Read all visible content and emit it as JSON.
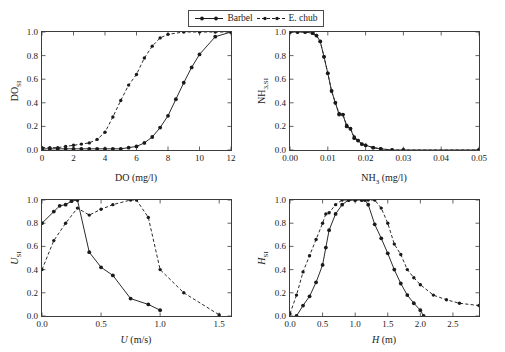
{
  "figure": {
    "background": "#ffffff",
    "line_color": "#2b2b2b",
    "marker_color": "#1a1a1a"
  },
  "legend": {
    "position": "top-center",
    "entries": [
      {
        "label": "Barbel",
        "style": "solid",
        "marker": "circle",
        "icon": "legend-solid-line-icon"
      },
      {
        "label": "E. chub",
        "style": "dashed",
        "marker": "circle",
        "icon": "legend-dashed-line-icon"
      }
    ]
  },
  "chart_data": [
    {
      "id": "do",
      "type": "line",
      "title": "",
      "xlabel": "DO (mg/l)",
      "ylabel": "DO_SI",
      "ylabel_main": "DO",
      "ylabel_sub": "SI",
      "xlim": [
        0,
        12
      ],
      "ylim": [
        0,
        1.0
      ],
      "xticks": [
        0,
        2,
        4,
        6,
        8,
        10,
        12
      ],
      "xticklabels": [
        "0",
        "2",
        "4",
        "6",
        "8",
        "10",
        "12"
      ],
      "yticks": [
        0.0,
        0.2,
        0.4,
        0.6,
        0.8,
        1.0
      ],
      "yticklabels": [
        "0.0",
        "0.2",
        "0.4",
        "0.6",
        "0.8",
        "1.0"
      ],
      "grid": false,
      "legend_position": "figure-top",
      "series": [
        {
          "name": "Barbel",
          "style": "solid",
          "x": [
            0,
            0.5,
            1.0,
            1.5,
            2.0,
            2.5,
            3.0,
            3.5,
            4.0,
            4.5,
            5.0,
            5.5,
            6.0,
            6.5,
            7.0,
            7.5,
            8.0,
            8.5,
            9.0,
            9.5,
            10.0,
            11.0,
            12.0
          ],
          "y": [
            0.01,
            0.01,
            0.01,
            0.01,
            0.01,
            0.01,
            0.01,
            0.01,
            0.01,
            0.01,
            0.01,
            0.02,
            0.03,
            0.06,
            0.11,
            0.19,
            0.29,
            0.43,
            0.57,
            0.7,
            0.81,
            0.96,
            1.0
          ]
        },
        {
          "name": "E. chub",
          "style": "dashed",
          "x": [
            0,
            0.5,
            1.0,
            1.5,
            2.0,
            2.5,
            3.0,
            3.5,
            4.0,
            4.5,
            5.0,
            5.5,
            6.0,
            6.5,
            7.0,
            7.5,
            8.0,
            9.0,
            10.0,
            11.0,
            12.0
          ],
          "y": [
            0.02,
            0.02,
            0.02,
            0.03,
            0.04,
            0.05,
            0.06,
            0.09,
            0.15,
            0.28,
            0.42,
            0.55,
            0.64,
            0.78,
            0.88,
            0.95,
            0.98,
            1.0,
            1.0,
            1.0,
            1.0
          ]
        }
      ]
    },
    {
      "id": "nh3",
      "type": "line",
      "title": "",
      "xlabel": "NH3 (mg/l)",
      "xlabel_main": "NH",
      "xlabel_sub": "3",
      "xlabel_unit": " (mg/l)",
      "ylabel": "NH3,SI",
      "ylabel_main": "NH",
      "ylabel_sub": "3,SI",
      "xlim": [
        0,
        0.05
      ],
      "ylim": [
        0,
        1.0
      ],
      "xticks": [
        0.0,
        0.01,
        0.02,
        0.03,
        0.04,
        0.05
      ],
      "xticklabels": [
        "0.00",
        "0.01",
        "0.02",
        "0.03",
        "0.04",
        "0.05"
      ],
      "yticks": [
        0.0,
        0.2,
        0.4,
        0.6,
        0.8,
        1.0
      ],
      "yticklabels": [
        "0.0",
        "0.2",
        "0.4",
        "0.6",
        "0.8",
        "1.0"
      ],
      "grid": false,
      "series": [
        {
          "name": "Barbel",
          "style": "solid",
          "x": [
            0.0,
            0.002,
            0.004,
            0.006,
            0.007,
            0.008,
            0.009,
            0.01,
            0.011,
            0.012,
            0.013,
            0.014,
            0.015,
            0.016,
            0.017,
            0.018,
            0.019,
            0.02,
            0.022,
            0.024,
            0.027,
            0.03,
            0.05
          ],
          "y": [
            1.0,
            1.0,
            1.0,
            0.99,
            0.97,
            0.92,
            0.79,
            0.65,
            0.5,
            0.4,
            0.3,
            0.3,
            0.2,
            0.18,
            0.1,
            0.08,
            0.05,
            0.04,
            0.02,
            0.01,
            0.0,
            0.0,
            0.0
          ]
        },
        {
          "name": "E. chub",
          "style": "dashed",
          "x": [
            0.0,
            0.002,
            0.004,
            0.006,
            0.007,
            0.008,
            0.009,
            0.01,
            0.011,
            0.012,
            0.013,
            0.014,
            0.015,
            0.016,
            0.017,
            0.018,
            0.019,
            0.02,
            0.022,
            0.024,
            0.027,
            0.03,
            0.05
          ],
          "y": [
            1.0,
            1.0,
            1.0,
            0.99,
            0.97,
            0.92,
            0.79,
            0.65,
            0.5,
            0.4,
            0.31,
            0.3,
            0.21,
            0.18,
            0.11,
            0.08,
            0.05,
            0.04,
            0.02,
            0.01,
            0.0,
            0.0,
            0.0
          ]
        }
      ]
    },
    {
      "id": "velocity",
      "type": "line",
      "title": "",
      "xlabel": "U (m/s)",
      "xlabel_main": "U",
      "xlabel_unit": " (m/s)",
      "ylabel": "U_SI",
      "ylabel_main": "U",
      "ylabel_sub": "SI",
      "xlim": [
        0,
        1.6
      ],
      "ylim": [
        0,
        1.0
      ],
      "xticks": [
        0.0,
        0.5,
        1.0,
        1.5
      ],
      "xticklabels": [
        "0.0",
        "0.5",
        "1.0",
        "1.5"
      ],
      "yticks": [
        0.0,
        0.2,
        0.4,
        0.6,
        0.8,
        1.0
      ],
      "yticklabels": [
        "0.0",
        "0.2",
        "0.4",
        "0.6",
        "0.8",
        "1.0"
      ],
      "grid": false,
      "series": [
        {
          "name": "Barbel",
          "style": "solid",
          "x": [
            0.0,
            0.1,
            0.15,
            0.2,
            0.25,
            0.3,
            0.4,
            0.5,
            0.6,
            0.75,
            0.9,
            1.0
          ],
          "y": [
            0.8,
            0.9,
            0.95,
            0.96,
            0.99,
            1.0,
            0.55,
            0.42,
            0.35,
            0.15,
            0.1,
            0.05
          ]
        },
        {
          "name": "E. chub",
          "style": "dashed",
          "x": [
            0.0,
            0.1,
            0.2,
            0.3,
            0.4,
            0.5,
            0.6,
            0.75,
            0.8,
            0.9,
            1.0,
            1.2,
            1.5
          ],
          "y": [
            0.4,
            0.65,
            0.8,
            0.93,
            0.87,
            0.92,
            0.96,
            1.0,
            1.0,
            0.85,
            0.4,
            0.2,
            0.01
          ]
        }
      ]
    },
    {
      "id": "depth",
      "type": "line",
      "title": "",
      "xlabel": "H (m)",
      "xlabel_main": "H",
      "xlabel_unit": " (m)",
      "ylabel": "H_SI",
      "ylabel_main": "H",
      "ylabel_sub": "SI",
      "xlim": [
        0,
        2.9
      ],
      "ylim": [
        0,
        1.0
      ],
      "xticks": [
        0.0,
        0.5,
        1.0,
        1.5,
        2.0,
        2.5
      ],
      "xticklabels": [
        "0.0",
        "0.5",
        "1.0",
        "1.5",
        "2.0",
        "2.5"
      ],
      "yticks": [
        0.0,
        0.2,
        0.4,
        0.6,
        0.8,
        1.0
      ],
      "yticklabels": [
        "0.0",
        "0.2",
        "0.4",
        "0.6",
        "0.8",
        "1.0"
      ],
      "grid": false,
      "series": [
        {
          "name": "Barbel",
          "style": "solid",
          "x": [
            0.1,
            0.2,
            0.3,
            0.4,
            0.5,
            0.55,
            0.6,
            0.7,
            0.8,
            0.9,
            1.0,
            1.1,
            1.15,
            1.2,
            1.3,
            1.4,
            1.5,
            1.6,
            1.7,
            1.8,
            1.9,
            2.0,
            2.05
          ],
          "y": [
            0.0,
            0.09,
            0.17,
            0.29,
            0.44,
            0.59,
            0.74,
            0.88,
            0.96,
            1.0,
            1.0,
            1.0,
            1.0,
            0.96,
            0.79,
            0.67,
            0.54,
            0.4,
            0.28,
            0.18,
            0.11,
            0.05,
            0.0
          ]
        },
        {
          "name": "E. chub",
          "style": "dashed",
          "x": [
            0.0,
            0.1,
            0.2,
            0.3,
            0.4,
            0.5,
            0.55,
            0.6,
            0.7,
            0.8,
            0.9,
            1.0,
            1.1,
            1.2,
            1.3,
            1.4,
            1.5,
            1.6,
            1.7,
            1.8,
            1.9,
            2.0,
            2.2,
            2.4,
            2.6,
            2.9
          ],
          "y": [
            0.02,
            0.18,
            0.38,
            0.52,
            0.66,
            0.8,
            0.88,
            0.89,
            0.96,
            1.0,
            1.0,
            1.0,
            1.0,
            1.0,
            1.0,
            0.93,
            0.8,
            0.62,
            0.53,
            0.4,
            0.33,
            0.27,
            0.18,
            0.14,
            0.11,
            0.09
          ]
        }
      ]
    }
  ]
}
